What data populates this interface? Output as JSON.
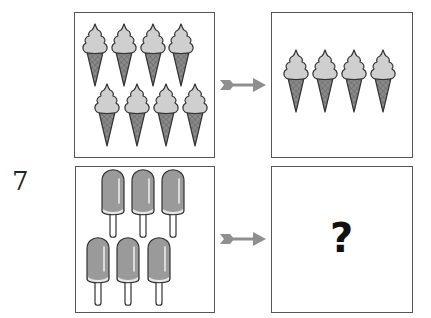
{
  "question": {
    "number": "7",
    "rows": [
      {
        "left_box": {
          "object": "ice-cream-cone",
          "count": 8,
          "layout": "two rows of 4"
        },
        "arrow": "arrow-right",
        "right_box": {
          "object": "ice-cream-cone",
          "count": 4,
          "layout": "one row of 4"
        }
      },
      {
        "left_box": {
          "object": "popsicle",
          "count": 6,
          "layout": "two rows of 3"
        },
        "arrow": "arrow-right",
        "right_box": {
          "content": "?"
        }
      }
    ]
  },
  "colors": {
    "border": "#555555",
    "scoop": "#cfcfcf",
    "cone": "#8a8a8a",
    "popsicle": "#9a9a9a",
    "arrow": "#8f8f8f"
  },
  "icons": {
    "ice_cream": "ice-cream-cone-icon",
    "popsicle": "popsicle-icon",
    "arrow": "arrow-right-icon"
  }
}
